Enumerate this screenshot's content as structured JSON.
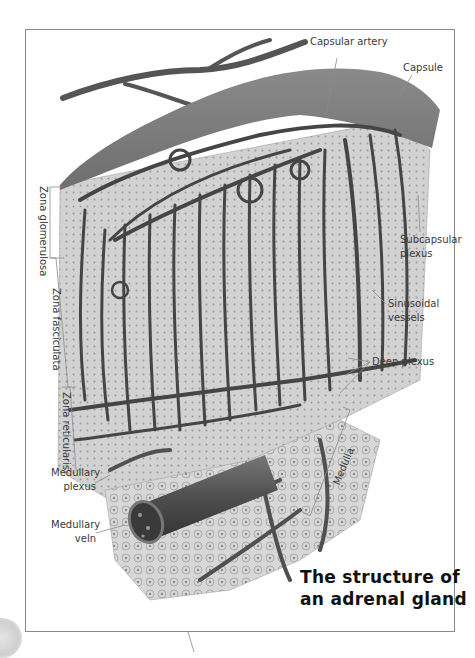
{
  "figure": {
    "title_line1": "The structure of",
    "title_line2": "an adrenal gland",
    "style": "grayscale anatomical illustration",
    "colors": {
      "frame_border": "#8a8a8a",
      "capsule": "#7a7a7a",
      "vessel": "#4a4a4a",
      "tissue": "#cfcfcf",
      "label_text": "#3a3a3a",
      "title_text": "#111111"
    }
  },
  "labels": {
    "capsular_artery": "Capsular artery",
    "capsule": "Capsule",
    "subcapsular_plexus_1": "Subcapsular",
    "subcapsular_plexus_2": "plexus",
    "sinusoidal_vessels_1": "Sinusoidal",
    "sinusoidal_vessels_2": "vessels",
    "deep_plexus": "Deep plexus",
    "medulla": "Medulla",
    "zona_glomerulosa": "Zona glomerulosa",
    "zona_fasciculata": "Zona fasciculata",
    "zona_reticularis": "Zona reticularis",
    "medullary_plexus_1": "Medullary",
    "medullary_plexus_2": "plexus",
    "medullary_vein_1": "Medullary",
    "medullary_vein_2": "veln"
  }
}
